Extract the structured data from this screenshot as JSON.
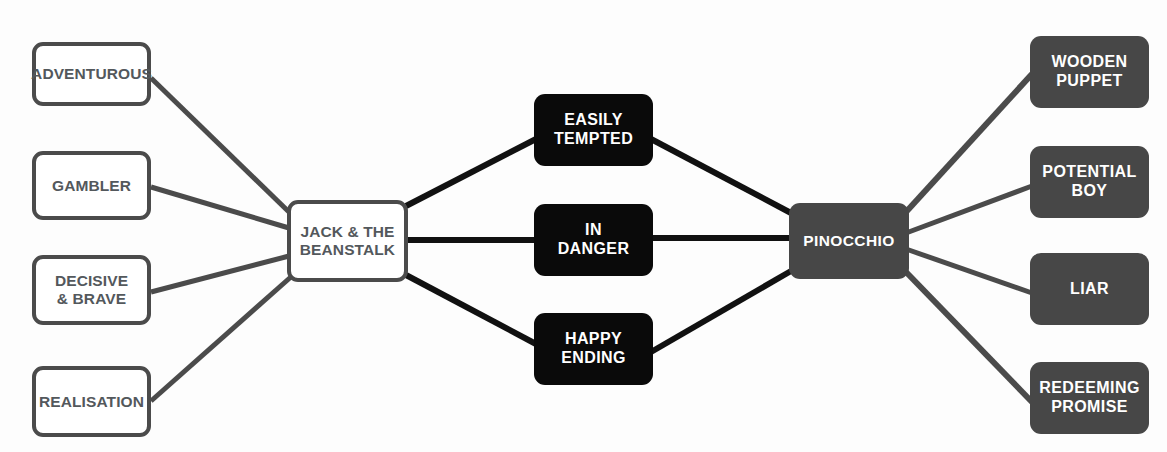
{
  "diagram": {
    "type": "concept-map",
    "canvas": {
      "width": 1167,
      "height": 452,
      "background": "#fdfdfd"
    },
    "palette": {
      "outline_fill": "#ffffff",
      "outline_stroke": "#4b4b4b",
      "outline_text": "#53585c",
      "black_fill": "#0a0a0a",
      "gray_fill": "#474747",
      "node_text_light": "#ffffff",
      "edge_dark": "#1a1a1a",
      "edge_gray": "#4b4b4b"
    },
    "nodes": [
      {
        "id": "adventurous",
        "label": "ADVENTUROUS",
        "style": "outline",
        "x": 32,
        "y": 42,
        "w": 119,
        "h": 64
      },
      {
        "id": "gambler",
        "label": "GAMBLER",
        "style": "outline",
        "x": 32,
        "y": 151,
        "w": 119,
        "h": 69
      },
      {
        "id": "decisive-brave",
        "label": "DECISIVE\n& BRAVE",
        "style": "outline",
        "x": 32,
        "y": 255,
        "w": 119,
        "h": 70
      },
      {
        "id": "realisation",
        "label": "REALISATION",
        "style": "outline",
        "x": 32,
        "y": 366,
        "w": 119,
        "h": 71
      },
      {
        "id": "jack-beanstalk",
        "label": "JACK & THE\nBEANSTALK",
        "style": "outline center-hub",
        "x": 287,
        "y": 200,
        "w": 121,
        "h": 82
      },
      {
        "id": "easily-tempted",
        "label": "EASILY\nTEMPTED",
        "style": "solid-black",
        "x": 534,
        "y": 94,
        "w": 119,
        "h": 72
      },
      {
        "id": "in-danger",
        "label": "IN\nDANGER",
        "style": "solid-black",
        "x": 534,
        "y": 204,
        "w": 119,
        "h": 72
      },
      {
        "id": "happy-ending",
        "label": "HAPPY\nENDING",
        "style": "solid-black",
        "x": 534,
        "y": 313,
        "w": 119,
        "h": 72
      },
      {
        "id": "pinocchio",
        "label": "PINOCCHIO",
        "style": "solid-gray pinocchio",
        "x": 789,
        "y": 203,
        "w": 120,
        "h": 76
      },
      {
        "id": "wooden-puppet",
        "label": "WOODEN\nPUPPET",
        "style": "solid-gray",
        "x": 1030,
        "y": 36,
        "w": 119,
        "h": 72
      },
      {
        "id": "potential-boy",
        "label": "POTENTIAL\nBOY",
        "style": "solid-gray",
        "x": 1030,
        "y": 146,
        "w": 119,
        "h": 72
      },
      {
        "id": "liar",
        "label": "LIAR",
        "style": "solid-gray",
        "x": 1030,
        "y": 253,
        "w": 119,
        "h": 72
      },
      {
        "id": "redeeming-promise",
        "label": "REDEEMING\nPROMISE",
        "style": "solid-gray",
        "x": 1030,
        "y": 362,
        "w": 119,
        "h": 72
      }
    ],
    "edges": [
      {
        "id": "adventurous-jack",
        "from": "adventurous",
        "to": "jack-beanstalk",
        "x1": 151,
        "y1": 78,
        "x2": 289,
        "y2": 212,
        "color": "#4b4b4b",
        "width": 5
      },
      {
        "id": "gambler-jack",
        "from": "gambler",
        "to": "jack-beanstalk",
        "x1": 151,
        "y1": 187,
        "x2": 289,
        "y2": 228,
        "color": "#4b4b4b",
        "width": 5
      },
      {
        "id": "decisive-jack",
        "from": "decisive-brave",
        "to": "jack-beanstalk",
        "x1": 151,
        "y1": 292,
        "x2": 289,
        "y2": 256,
        "color": "#4b4b4b",
        "width": 5
      },
      {
        "id": "realisation-jack",
        "from": "realisation",
        "to": "jack-beanstalk",
        "x1": 151,
        "y1": 401,
        "x2": 292,
        "y2": 276,
        "color": "#4b4b4b",
        "width": 5
      },
      {
        "id": "jack-easily-tempted",
        "from": "jack-beanstalk",
        "to": "easily-tempted",
        "x1": 406,
        "y1": 206,
        "x2": 536,
        "y2": 139,
        "color": "#111111",
        "width": 6
      },
      {
        "id": "jack-in-danger",
        "from": "jack-beanstalk",
        "to": "in-danger",
        "x1": 406,
        "y1": 240,
        "x2": 536,
        "y2": 240,
        "color": "#111111",
        "width": 6
      },
      {
        "id": "jack-happy-ending",
        "from": "jack-beanstalk",
        "to": "happy-ending",
        "x1": 406,
        "y1": 275,
        "x2": 536,
        "y2": 344,
        "color": "#111111",
        "width": 6
      },
      {
        "id": "easily-tempted-pinocchio",
        "from": "easily-tempted",
        "to": "pinocchio",
        "x1": 651,
        "y1": 139,
        "x2": 791,
        "y2": 213,
        "color": "#111111",
        "width": 6
      },
      {
        "id": "in-danger-pinocchio",
        "from": "in-danger",
        "to": "pinocchio",
        "x1": 651,
        "y1": 238,
        "x2": 791,
        "y2": 238,
        "color": "#111111",
        "width": 6
      },
      {
        "id": "happy-ending-pinocchio",
        "from": "happy-ending",
        "to": "pinocchio",
        "x1": 651,
        "y1": 352,
        "x2": 791,
        "y2": 271,
        "color": "#111111",
        "width": 6
      },
      {
        "id": "pinocchio-wooden-puppet",
        "from": "pinocchio",
        "to": "wooden-puppet",
        "x1": 906,
        "y1": 212,
        "x2": 1032,
        "y2": 74,
        "color": "#4b4b4b",
        "width": 6
      },
      {
        "id": "pinocchio-potential-boy",
        "from": "pinocchio",
        "to": "potential-boy",
        "x1": 906,
        "y1": 233,
        "x2": 1032,
        "y2": 186,
        "color": "#4b4b4b",
        "width": 5
      },
      {
        "id": "pinocchio-liar",
        "from": "pinocchio",
        "to": "liar",
        "x1": 906,
        "y1": 249,
        "x2": 1032,
        "y2": 293,
        "color": "#4b4b4b",
        "width": 5
      },
      {
        "id": "pinocchio-redeeming-promise",
        "from": "pinocchio",
        "to": "redeeming-promise",
        "x1": 906,
        "y1": 272,
        "x2": 1032,
        "y2": 402,
        "color": "#4b4b4b",
        "width": 6
      }
    ]
  }
}
